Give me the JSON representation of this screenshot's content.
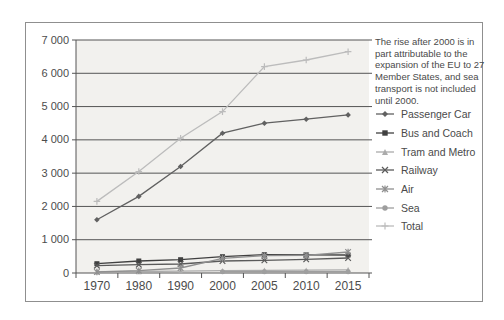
{
  "annotation": {
    "text": "The rise after 2000 is in\npart attributable to the\nexpansion of the EU to 27\nMember States, and sea\ntransport is not included\nuntil 2000."
  },
  "chart_data": {
    "type": "line",
    "categories": [
      "1970",
      "1980",
      "1990",
      "2000",
      "2005",
      "2010",
      "2015"
    ],
    "series": [
      {
        "name": "Passenger Car",
        "marker": "diamond",
        "color": "#616161",
        "values": [
          1600,
          2300,
          3200,
          4200,
          4500,
          4620,
          4750
        ]
      },
      {
        "name": "Bus and Coach",
        "marker": "square",
        "color": "#404040",
        "values": [
          280,
          360,
          400,
          490,
          550,
          545,
          540
        ]
      },
      {
        "name": "Tram and Metro",
        "marker": "triangle",
        "color": "#ababab",
        "values": [
          40,
          45,
          55,
          70,
          80,
          85,
          95
        ]
      },
      {
        "name": "Railway",
        "marker": "x",
        "color": "#5a5a5a",
        "values": [
          220,
          250,
          270,
          360,
          380,
          410,
          450
        ]
      },
      {
        "name": "Air",
        "marker": "asterisk",
        "color": "#8f8f8f",
        "values": [
          30,
          70,
          150,
          440,
          520,
          530,
          630
        ]
      },
      {
        "name": "Sea",
        "marker": "circle",
        "color": "#9e9e9e",
        "values": [
          null,
          null,
          null,
          40,
          40,
          40,
          40
        ]
      },
      {
        "name": "Total",
        "marker": "plus",
        "color": "#bcbcbc",
        "values": [
          2150,
          3050,
          4050,
          4850,
          6200,
          6400,
          6650
        ]
      }
    ],
    "ylim": [
      0,
      7000
    ],
    "ytick_step": 1000,
    "ytick_labels": [
      "0",
      "1 000",
      "2 000",
      "3 000",
      "4 000",
      "5 000",
      "6 000",
      "7 000"
    ],
    "grid": true,
    "legend_position": "right",
    "plot_background": "#f2f1ee",
    "grid_color": "#555555",
    "axis_text_color": "#4c4c4c"
  }
}
